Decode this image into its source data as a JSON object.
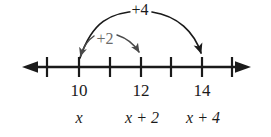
{
  "figure": {
    "type": "number-line-diagram",
    "background_color": "#ffffff",
    "line_color": "#1a1a1a",
    "gray_color": "#6b6b6b"
  },
  "number_line": {
    "axis_name": "number-line-axis",
    "left_arrow": "left-arrowhead",
    "right_arrow": "right-arrowhead",
    "tick_count": 7,
    "tick_positions_px": [
      47,
      79,
      110,
      141,
      171,
      202,
      232
    ],
    "labeled_ticks": [
      {
        "index": 1,
        "value": "10",
        "x": 79
      },
      {
        "index": 3,
        "value": "12",
        "x": 141
      },
      {
        "index": 5,
        "value": "14",
        "x": 202
      }
    ],
    "unlabeled_tick_indices": [
      0,
      2,
      4,
      6
    ]
  },
  "expressions": [
    {
      "text": "x",
      "x": 79,
      "under": "10"
    },
    {
      "text": "x + 2",
      "x": 141,
      "under": "12"
    },
    {
      "text": "x + 4",
      "x": 202,
      "under": "14"
    }
  ],
  "jumps": [
    {
      "label": "+2",
      "name": "jump-arc-plus-2",
      "from_value": "10",
      "to_value": "12",
      "from_x": 79,
      "to_x": 141,
      "color": "#6b6b6b",
      "label_x": 101,
      "label_y": 32,
      "arrowhead_at": "both"
    },
    {
      "label": "+4",
      "name": "jump-arc-plus-4",
      "from_value": "10",
      "to_value": "14",
      "from_x": 79,
      "to_x": 202,
      "color": "#1a1a1a",
      "label_x": 140,
      "label_y": 2,
      "arrowhead_at": "end"
    }
  ]
}
